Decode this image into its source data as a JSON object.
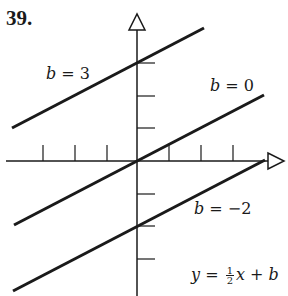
{
  "problem_number": "39.",
  "line_labels": {
    "b3": {
      "var": "b",
      "text": " = 3"
    },
    "b0": {
      "var": "b",
      "text": " = 0"
    },
    "bm2": {
      "var": "b",
      "text": " = −2"
    }
  },
  "equation": {
    "y": "y",
    "equals": " = ",
    "num": "1",
    "den": "2",
    "x": "x",
    "plus": " + ",
    "b": "b"
  },
  "colors": {
    "ink": "#1a1a1a",
    "background": "#ffffff"
  }
}
